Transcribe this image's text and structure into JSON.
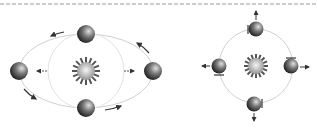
{
  "diagram": {
    "title": "",
    "colors": {
      "orbit": "#cccccc",
      "dashed_line": "#888888",
      "arrow": "#333333",
      "planet_dark": "#2a2a2a",
      "planet_light": "#cfcfcf",
      "sun_rays": "#555555",
      "sun_light": "#f2f2f2"
    },
    "panels": [
      {
        "name": "elliptical-orbit",
        "planets": 4,
        "orbit_shape": "ellipse"
      },
      {
        "name": "circular-orbit",
        "planets": 4,
        "orbit_shape": "circle"
      }
    ]
  }
}
